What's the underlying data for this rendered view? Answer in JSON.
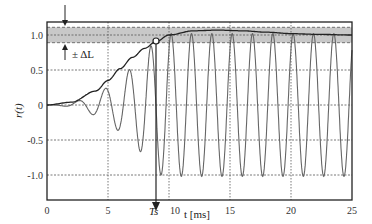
{
  "chart_data": {
    "type": "line",
    "title": "",
    "xlabel": "t [ms]",
    "ylabel": "r(t)",
    "xlim": [
      0,
      25
    ],
    "ylim": [
      -1.2,
      1.2
    ],
    "grid": true,
    "x_ticks": [
      0,
      5,
      10,
      15,
      20,
      25
    ],
    "x_tick_labels": [
      "0",
      "5",
      "10",
      "15",
      "20",
      "25"
    ],
    "y_ticks": [
      -1.0,
      -0.5,
      0,
      0.5,
      1.0
    ],
    "y_tick_labels": [
      "-1.0",
      "-0.5",
      "0",
      "0.5",
      "1.0"
    ],
    "series": [
      {
        "name": "r(t) oscillating response",
        "description": "Chirp-like oscillation, amplitude grows from ~0 to ~1 by t≈9 ms, period ~1.7 ms",
        "x": [
          0,
          1,
          2,
          2.5,
          3,
          3.5,
          4,
          4.5,
          5,
          5.5,
          6,
          6.5,
          7,
          7.5,
          8,
          8.5,
          9,
          9.5,
          10
        ],
        "y": [
          0,
          -0.01,
          0.02,
          -0.05,
          0.1,
          -0.15,
          0.3,
          -0.4,
          0.55,
          -0.65,
          0.75,
          -0.85,
          0.88,
          -0.95,
          0.97,
          -1.0,
          1.03,
          -1.02,
          1.02
        ]
      },
      {
        "name": "envelope",
        "description": "Smooth rising envelope, crosses band at Ts, peaks ~1.07 near t≈13 ms, settles to ~1.0",
        "x": [
          0,
          2,
          4,
          5,
          6,
          7,
          8,
          8.9,
          10,
          12,
          14,
          16,
          18,
          20,
          22,
          25
        ],
        "y": [
          0.0,
          0.04,
          0.2,
          0.35,
          0.52,
          0.68,
          0.81,
          0.9,
          1.0,
          1.06,
          1.07,
          1.06,
          1.04,
          1.02,
          1.01,
          1.0
        ]
      }
    ],
    "annotations": [
      {
        "type": "band",
        "y_center": 1.0,
        "half_width": 0.11,
        "label": "± ΔL",
        "fill": "#c8c8c8"
      },
      {
        "type": "marker",
        "x": 8.9,
        "y": 0.9,
        "shape": "open-circle"
      },
      {
        "type": "vline-arrow",
        "x": 8.9,
        "label": "Ts"
      }
    ],
    "x_special_label": "Ts",
    "band_label": "± ΔL",
    "legend": "none"
  },
  "colors": {
    "signal": "#666666",
    "envelope": "#222222",
    "band": "#c8c8c8",
    "grid": "#555555",
    "frame": "#222222"
  }
}
